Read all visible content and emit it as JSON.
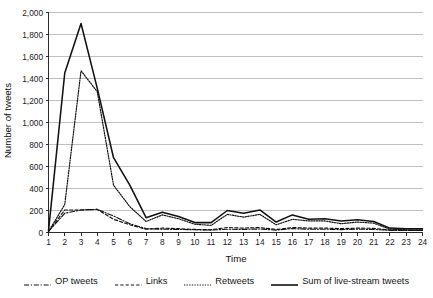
{
  "chart_data": {
    "type": "line",
    "title": "",
    "xlabel": "Time",
    "ylabel": "Number of tweets",
    "xlim": [
      1,
      24
    ],
    "ylim": [
      0,
      2000
    ],
    "grid": true,
    "legend_position": "bottom",
    "x": [
      1,
      2,
      3,
      4,
      5,
      6,
      7,
      8,
      9,
      10,
      11,
      12,
      13,
      14,
      15,
      16,
      17,
      18,
      19,
      20,
      21,
      22,
      23,
      24
    ],
    "ytick_labels": [
      "0",
      "200",
      "400",
      "600",
      "800",
      "1,000",
      "1,200",
      "1,400",
      "1,600",
      "1,800",
      "2,000"
    ],
    "ytick_values": [
      0,
      200,
      400,
      600,
      800,
      1000,
      1200,
      1400,
      1600,
      1800,
      2000
    ],
    "xtick_labels": [
      "1",
      "2",
      "3",
      "4",
      "5",
      "6",
      "7",
      "8",
      "9",
      "10",
      "11",
      "12",
      "13",
      "14",
      "15",
      "16",
      "17",
      "18",
      "19",
      "20",
      "21",
      "22",
      "23",
      "24"
    ],
    "series": [
      {
        "name": "OP tweets",
        "style": "dashdot",
        "values": [
          10,
          175,
          205,
          210,
          150,
          80,
          35,
          30,
          28,
          25,
          22,
          30,
          28,
          32,
          22,
          35,
          30,
          30,
          26,
          30,
          28,
          20,
          18,
          18
        ]
      },
      {
        "name": "Links",
        "style": "dashed",
        "values": [
          10,
          205,
          205,
          210,
          120,
          70,
          30,
          40,
          35,
          28,
          25,
          45,
          40,
          45,
          28,
          45,
          40,
          40,
          35,
          40,
          38,
          22,
          20,
          20
        ]
      },
      {
        "name": "Retweets",
        "style": "dotted",
        "values": [
          8,
          255,
          1470,
          1280,
          430,
          235,
          100,
          160,
          125,
          75,
          65,
          165,
          140,
          165,
          70,
          120,
          105,
          105,
          80,
          95,
          85,
          30,
          25,
          25
        ]
      },
      {
        "name": "Sum of live-stream tweets",
        "style": "solid",
        "values": [
          15,
          1450,
          1900,
          1310,
          680,
          430,
          135,
          185,
          145,
          90,
          90,
          200,
          175,
          205,
          95,
          160,
          120,
          125,
          105,
          115,
          100,
          40,
          35,
          35
        ]
      }
    ]
  },
  "legend": {
    "items": [
      {
        "label": "OP tweets",
        "icon": "dashdot-line-icon"
      },
      {
        "label": "Links",
        "icon": "dashed-line-icon"
      },
      {
        "label": "Retweets",
        "icon": "dotted-line-icon"
      },
      {
        "label": "Sum of live-stream tweets",
        "icon": "solid-line-icon"
      }
    ]
  }
}
